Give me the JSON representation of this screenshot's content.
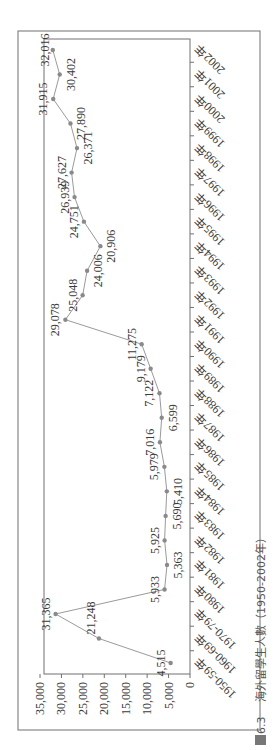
{
  "caption": {
    "figure_number": "圖6.3",
    "title": "海外留學生人數（1950-2002年）"
  },
  "colors": {
    "line": "#9a9a9a",
    "marker": "#8a8a8a",
    "frame": "#707070",
    "text": "#3a3a3a"
  },
  "chart_data": {
    "type": "line",
    "title": "海外留學生人數（1950-2002年）",
    "figure_number": "圖6.3",
    "xlabel": "",
    "ylabel": "",
    "ylim": [
      0,
      35000
    ],
    "yticks": [
      0,
      5000,
      10000,
      15000,
      20000,
      25000,
      30000,
      35000
    ],
    "ytick_labels": [
      "0",
      "5,000",
      "10,000",
      "15,000",
      "20,000",
      "25,000",
      "30,000",
      "35,000"
    ],
    "grid": false,
    "legend": null,
    "orientation_note": "figure printed rotated 90° counter-clockwise on page",
    "categories": [
      "1950-59年",
      "1960-69年",
      "1970-79年",
      "1980年",
      "1981年",
      "1982年",
      "1983年",
      "1984年",
      "1985年",
      "1986年",
      "1987年",
      "1988年",
      "1989年",
      "1990年",
      "1991年",
      "1992年",
      "1993年",
      "1994年",
      "1995年",
      "1996年",
      "1997年",
      "1998年",
      "1999年",
      "2000年",
      "2001年",
      "2002年"
    ],
    "series": [
      {
        "name": "海外留學生人數",
        "values": [
          4515,
          21248,
          31365,
          5933,
          5363,
          5925,
          5690,
          5410,
          5979,
          7016,
          6599,
          7122,
          9179,
          11275,
          29078,
          25048,
          24006,
          20906,
          24751,
          26939,
          27627,
          26371,
          27890,
          31915,
          30402,
          32016
        ],
        "labels": [
          "4,515",
          "21,248",
          "31,365",
          "5,933",
          "5,363",
          "5,925",
          "5,690",
          "5,410",
          "5,979",
          "7,016",
          "6,599",
          "7,122",
          "9,179",
          "11,275",
          "29,078",
          "25,048",
          "24,006",
          "20,906",
          "24,751",
          "26,939",
          "27,627",
          "26,371",
          "27,890",
          "31,915",
          "30,402",
          "32,016"
        ],
        "label_side": [
          "above",
          "right",
          "above",
          "above",
          "below",
          "above",
          "below",
          "below",
          "above",
          "above",
          "below",
          "above",
          "above",
          "above",
          "above",
          "above",
          "below",
          "below",
          "above",
          "above",
          "above",
          "below",
          "below",
          "above",
          "below",
          "above"
        ]
      }
    ]
  }
}
